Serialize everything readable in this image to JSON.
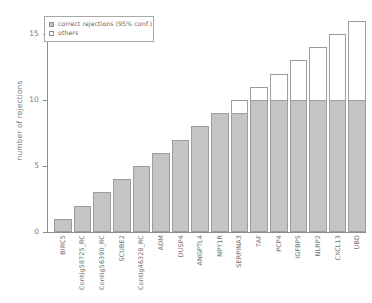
{
  "chart_data": {
    "type": "bar",
    "stacked": true,
    "title": "",
    "subtitle": "",
    "xlabel": "",
    "ylabel": "number of rejections",
    "ylim": [
      0,
      17
    ],
    "yticks": [
      0,
      5,
      10,
      15
    ],
    "ytick_labels": [
      "0",
      "5",
      "10",
      "15"
    ],
    "grid": false,
    "legend_position": "top-left",
    "categories": [
      "BIRC5",
      "Contig58725_RC",
      "Contig56390_RC",
      "SCUBE2",
      "Contig46328_RC",
      "ADM",
      "DUSP4",
      "ANGPTL4",
      "NPY1R",
      "SERPINA3",
      "TAF",
      "PCP4",
      "IGFBP5",
      "NLRP2",
      "CXCL13",
      "UBD"
    ],
    "totals": [
      1,
      2,
      3,
      4,
      5,
      6,
      7,
      8,
      9,
      10,
      11,
      12,
      13,
      14,
      15,
      16
    ],
    "series": [
      {
        "name": "correct rejections (95% conf.)",
        "color": "#c4c4c4",
        "values": [
          1,
          2,
          3,
          4,
          5,
          6,
          7,
          8,
          9,
          9,
          10,
          10,
          10,
          10,
          10,
          10
        ]
      },
      {
        "name": "others",
        "color": "#ffffff",
        "values": [
          0,
          0,
          0,
          0,
          0,
          0,
          0,
          0,
          0,
          1,
          1,
          2,
          3,
          4,
          5,
          6
        ]
      }
    ]
  },
  "legend": {
    "items": [
      {
        "label": "correct rejections (95% conf.)",
        "swatch": "correct"
      },
      {
        "label": "others",
        "swatch": "others"
      }
    ]
  },
  "axes": {
    "y_title": "number of rejections"
  }
}
